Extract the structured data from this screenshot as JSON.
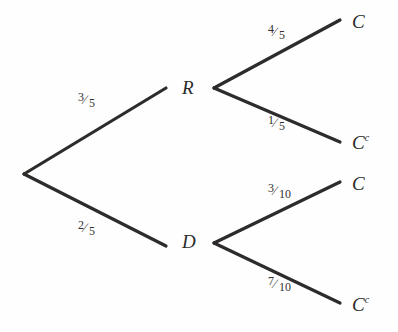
{
  "diagram": {
    "type": "probability-tree",
    "background_color": "#fefefe",
    "line_color": "#2e2c2b",
    "text_color": "#2b2b2b",
    "nodes": [
      {
        "id": "root",
        "label": "",
        "superscript": "",
        "x": 24,
        "y": 174
      },
      {
        "id": "R",
        "label": "R",
        "superscript": "",
        "x": 182,
        "y": 88
      },
      {
        "id": "D",
        "label": "D",
        "superscript": "",
        "x": 182,
        "y": 242
      },
      {
        "id": "RC",
        "label": "C",
        "superscript": "",
        "x": 352,
        "y": 22
      },
      {
        "id": "RCc",
        "label": "C",
        "superscript": "c",
        "x": 352,
        "y": 143
      },
      {
        "id": "DC",
        "label": "C",
        "superscript": "",
        "x": 352,
        "y": 184
      },
      {
        "id": "DCc",
        "label": "C",
        "superscript": "c",
        "x": 352,
        "y": 305
      }
    ],
    "edges": [
      {
        "id": "root-R",
        "from": "root",
        "to": "R",
        "x1": 24,
        "y1": 174,
        "x2": 166,
        "y2": 88,
        "numerator": "3",
        "denominator": "5",
        "label_x": 78,
        "label_y": 101
      },
      {
        "id": "root-D",
        "from": "root",
        "to": "D",
        "x1": 24,
        "y1": 174,
        "x2": 166,
        "y2": 246,
        "numerator": "2",
        "denominator": "5",
        "label_x": 78,
        "label_y": 229
      },
      {
        "id": "R-C",
        "from": "R",
        "to": "RC",
        "x1": 214,
        "y1": 88,
        "x2": 340,
        "y2": 20,
        "numerator": "4",
        "denominator": "5",
        "label_x": 268,
        "label_y": 33
      },
      {
        "id": "R-Cc",
        "from": "R",
        "to": "RCc",
        "x1": 214,
        "y1": 88,
        "x2": 340,
        "y2": 142,
        "numerator": "1",
        "denominator": "5",
        "label_x": 268,
        "label_y": 124
      },
      {
        "id": "D-C",
        "from": "D",
        "to": "DC",
        "x1": 214,
        "y1": 243,
        "x2": 340,
        "y2": 182,
        "numerator": "3",
        "denominator": "10",
        "label_x": 268,
        "label_y": 192
      },
      {
        "id": "D-Cc",
        "from": "D",
        "to": "DCc",
        "x1": 214,
        "y1": 243,
        "x2": 340,
        "y2": 303,
        "numerator": "7",
        "denominator": "10",
        "label_x": 268,
        "label_y": 285
      }
    ]
  },
  "chart_data": {
    "type": "tree",
    "root": "",
    "levels": 2,
    "level1_labels": [
      "R",
      "D"
    ],
    "level1_probabilities": [
      "3/5",
      "2/5"
    ],
    "level2_labels": [
      "C",
      "C^c",
      "C",
      "C^c"
    ],
    "level2_probabilities": [
      "4/5",
      "1/5",
      "3/10",
      "7/10"
    ],
    "branches": [
      {
        "path": [
          "R",
          "C"
        ],
        "probabilities": [
          "3/5",
          "4/5"
        ]
      },
      {
        "path": [
          "R",
          "C^c"
        ],
        "probabilities": [
          "3/5",
          "1/5"
        ]
      },
      {
        "path": [
          "D",
          "C"
        ],
        "probabilities": [
          "2/5",
          "3/10"
        ]
      },
      {
        "path": [
          "D",
          "C^c"
        ],
        "probabilities": [
          "2/5",
          "7/10"
        ]
      }
    ]
  }
}
